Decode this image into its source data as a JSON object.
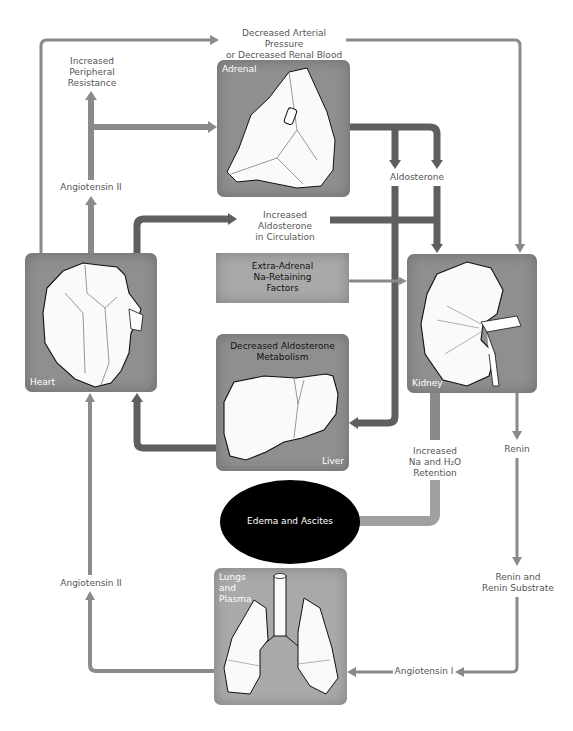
{
  "colors": {
    "background": "#ffffff",
    "thick_arrow": "#5f5f5f",
    "thin_arrow": "#8a8a8a",
    "box_fill": "#8f8f8f",
    "ellipse_fill": "#000000",
    "label_text": "#555555"
  },
  "labels": {
    "top_trigger_line1": "Decreased Arterial Pressure",
    "top_trigger_line2": "or Decreased Renal Blood Flow",
    "peripheral_line1": "Increased",
    "peripheral_line2": "Peripheral",
    "peripheral_line3": "Resistance",
    "angiotensin_ii_upper": "Angiotensin II",
    "aldosterone": "Aldosterone",
    "aldosterone_circ_line1": "Increased Aldosterone",
    "aldosterone_circ_line2": "in Circulation",
    "na_retention_line1": "Increased",
    "na_retention_line2": "Na and H₂O",
    "na_retention_line3": "Retention",
    "renin": "Renin",
    "renin_substrate_line1": "Renin and",
    "renin_substrate_line2": "Renin Substrate",
    "angiotensin_i": "Angiotensin I",
    "angiotensin_ii_lower": "Angiotensin II"
  },
  "boxes": {
    "adrenal": {
      "label": "Adrenal"
    },
    "heart": {
      "label": "Heart"
    },
    "extra_adrenal": {
      "line1": "Extra-Adrenal",
      "line2": "Na-Retaining",
      "line3": "Factors"
    },
    "liver": {
      "title_line1": "Decreased Aldosterone",
      "title_line2": "Metabolism",
      "label": "Liver"
    },
    "kidney": {
      "label": "Kidney"
    },
    "lungs": {
      "line1": "Lungs",
      "line2": "and",
      "line3": "Plasma"
    }
  },
  "ellipse": {
    "label": "Edema and Ascites"
  }
}
